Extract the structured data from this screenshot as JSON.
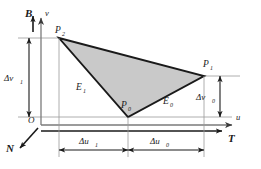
{
  "figure": {
    "background_color": "#ffffff",
    "triangle_fill_color": "#c9c9c9",
    "triangle_stroke_color": "#1a1a1a",
    "axis_color": "#7a7a7a",
    "text_color": "#1a1a1a"
  },
  "axes": {
    "vertical_axis_label": "v",
    "horizontal_axis_label": "u",
    "origin_label": "O",
    "frame_vectors": {
      "up_label": "B",
      "right_label": "T",
      "out_label": "N"
    }
  },
  "vertices": {
    "p0": {
      "label": "P",
      "subscript": "0",
      "x": 128,
      "y": 117
    },
    "p1": {
      "label": "P",
      "subscript": "1",
      "x": 204,
      "y": 76
    },
    "p2": {
      "label": "P",
      "subscript": "2",
      "x": 59,
      "y": 38
    }
  },
  "edges": {
    "e0": {
      "label": "E",
      "subscript": "0"
    },
    "e1": {
      "label": "E",
      "subscript": "1"
    }
  },
  "dimensions": {
    "dv1": {
      "label": "Δv",
      "subscript": "1"
    },
    "dv0": {
      "label": "Δv",
      "subscript": "0"
    },
    "du1": {
      "label": "Δu",
      "subscript": "1"
    },
    "du0": {
      "label": "Δu",
      "subscript": "0"
    }
  }
}
